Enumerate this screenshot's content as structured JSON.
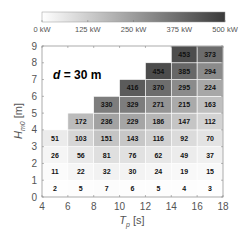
{
  "chart_data": {
    "type": "heatmap",
    "title": "",
    "annotation": "d = 30 m",
    "annotation_parts": {
      "var": "d",
      "rest": " = 30 m"
    },
    "xlabel": "T_p [s]",
    "xlabel_parts": {
      "main": "T",
      "sub": "p",
      "unit": " [s]"
    },
    "ylabel": "H_m0 [m]",
    "ylabel_parts": {
      "main": "H",
      "sub": "m0",
      "unit": " [m]"
    },
    "xlim": [
      4,
      18
    ],
    "ylim": [
      0,
      9
    ],
    "xticks": [
      4,
      6,
      8,
      10,
      12,
      14,
      16,
      18
    ],
    "yticks": [
      0,
      1,
      2,
      3,
      4,
      5,
      6,
      7,
      8,
      9
    ],
    "grid": true,
    "colorbar": {
      "position": "top",
      "range": [
        0,
        500
      ],
      "unit": "kW",
      "ticks": [
        0,
        125,
        250,
        375,
        500
      ],
      "tick_labels": [
        "0 kW",
        "125 kW",
        "250 kW",
        "375 kW",
        "500 kW"
      ],
      "colormap": "white-to-dark-gray"
    },
    "x_bin_centers": [
      5,
      7,
      9,
      11,
      13,
      15,
      17
    ],
    "y_bin_centers": [
      0.5,
      1.5,
      2.5,
      3.5,
      4.5,
      5.5,
      6.5,
      7.5,
      8.5
    ],
    "bin_width_x": 2,
    "bin_height_y": 1,
    "values_by_column": [
      {
        "Tp": 5,
        "values": [
          2,
          11,
          26,
          51
        ]
      },
      {
        "Tp": 7,
        "values": [
          5,
          22,
          56,
          103,
          172
        ]
      },
      {
        "Tp": 9,
        "values": [
          7,
          32,
          81,
          151,
          236,
          330
        ]
      },
      {
        "Tp": 11,
        "values": [
          6,
          30,
          76,
          143,
          229,
          329,
          416
        ]
      },
      {
        "Tp": 13,
        "values": [
          5,
          24,
          62,
          116,
          186,
          271,
          370,
          454
        ]
      },
      {
        "Tp": 15,
        "values": [
          4,
          19,
          49,
          92,
          147,
          215,
          295,
          385,
          453
        ]
      },
      {
        "Tp": 17,
        "values": [
          3,
          15,
          37,
          70,
          112,
          163,
          224,
          294,
          373
        ]
      }
    ],
    "value_unit": "kW"
  },
  "colors": {
    "low": "#ffffff",
    "high": "#3a3a3a",
    "axis": "#888888",
    "gridline": "#ffffff"
  }
}
